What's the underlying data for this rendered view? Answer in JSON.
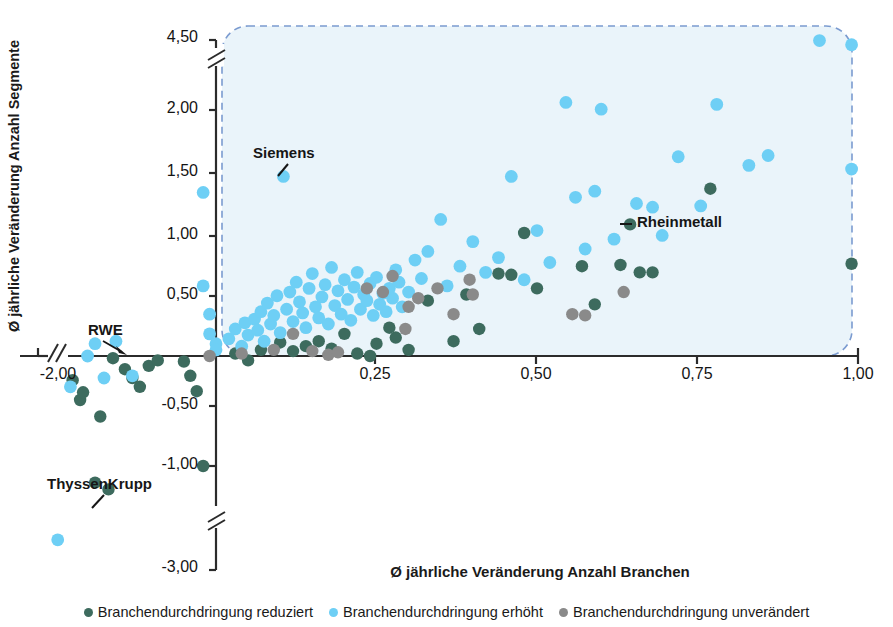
{
  "chart_data": {
    "type": "scatter",
    "title": "",
    "xlabel": "Ø jährliche Veränderung Anzahl Branchen",
    "ylabel": "Ø jährliche Veränderung Anzahl Segmente",
    "xlim": [
      -2.25,
      1.05
    ],
    "ylim": [
      -3.1,
      4.7
    ],
    "grid": false,
    "legend_position": "bottom",
    "x_ticks": [
      {
        "value": -2.0,
        "label": "-2,00"
      },
      {
        "value": 0.25,
        "label": "0,25"
      },
      {
        "value": 0.5,
        "label": "0,50"
      },
      {
        "value": 0.75,
        "label": "0,75"
      },
      {
        "value": 1.0,
        "label": "1,00"
      }
    ],
    "y_ticks": [
      {
        "value": 4.5,
        "label": "4,50"
      },
      {
        "value": 2.0,
        "label": "2,00"
      },
      {
        "value": 1.5,
        "label": "1,50"
      },
      {
        "value": 1.0,
        "label": "1,00"
      },
      {
        "value": 0.5,
        "label": "0,50"
      },
      {
        "value": -0.5,
        "label": "-0,50"
      },
      {
        "value": -1.0,
        "label": "-1,00"
      },
      {
        "value": -3.0,
        "label": "-3,00"
      }
    ],
    "axis_breaks": {
      "y_upper": "between 2,00 and 4,50",
      "y_lower": "between -1,00 and -3,00",
      "x_left": "left of -2,00"
    },
    "highlight_region": {
      "label": "dashed rounded rectangle around positive quadrant",
      "x_from": 0.0,
      "x_to": 1.0,
      "y_from": 0.0,
      "y_to": 4.5,
      "color": "#6f8fc4"
    },
    "annotations": [
      {
        "text": "Siemens",
        "point_x": 0.105,
        "point_y": 1.46,
        "series": "erhöht"
      },
      {
        "text": "Rheinmetall",
        "point_x": 0.645,
        "point_y": 1.07,
        "series": "reduziert"
      },
      {
        "text": "RWE",
        "point_x": -1.72,
        "point_y": 0.0,
        "series": "erhöht"
      },
      {
        "text": "ThyssenKrupp",
        "point_x": -1.62,
        "point_y": -1.32,
        "series": "reduziert"
      }
    ],
    "series": [
      {
        "name": "Branchendurchdringung reduziert",
        "color": "#3d6b5e",
        "points": [
          [
            -1.92,
            -0.22
          ],
          [
            -1.82,
            -0.4
          ],
          [
            -1.78,
            -0.33
          ],
          [
            -1.62,
            -1.32
          ],
          [
            -1.55,
            -0.55
          ],
          [
            -1.44,
            -1.45
          ],
          [
            -1.38,
            -0.02
          ],
          [
            -1.22,
            -0.12
          ],
          [
            -1.12,
            -0.2
          ],
          [
            -1.02,
            -0.28
          ],
          [
            -0.9,
            -0.09
          ],
          [
            -0.78,
            -0.04
          ],
          [
            -0.05,
            -0.05
          ],
          [
            -0.04,
            -0.18
          ],
          [
            -0.03,
            -0.32
          ],
          [
            -0.02,
            -1.0
          ],
          [
            0.03,
            0.02
          ],
          [
            0.05,
            -0.04
          ],
          [
            0.07,
            0.05
          ],
          [
            0.1,
            0.11
          ],
          [
            0.12,
            0.04
          ],
          [
            0.14,
            0.08
          ],
          [
            0.16,
            0.12
          ],
          [
            0.18,
            0.06
          ],
          [
            0.2,
            0.18
          ],
          [
            0.22,
            0.02
          ],
          [
            0.24,
            0.0
          ],
          [
            0.25,
            0.1
          ],
          [
            0.27,
            0.23
          ],
          [
            0.28,
            0.15
          ],
          [
            0.3,
            0.05
          ],
          [
            0.33,
            0.45
          ],
          [
            0.37,
            0.12
          ],
          [
            0.39,
            0.5
          ],
          [
            0.41,
            0.22
          ],
          [
            0.44,
            0.67
          ],
          [
            0.46,
            0.66
          ],
          [
            0.48,
            1.0
          ],
          [
            0.5,
            0.55
          ],
          [
            0.57,
            0.73
          ],
          [
            0.59,
            0.42
          ],
          [
            0.63,
            0.74
          ],
          [
            0.645,
            1.07
          ],
          [
            0.66,
            0.68
          ],
          [
            0.68,
            0.68
          ],
          [
            0.77,
            1.36
          ],
          [
            0.99,
            0.75
          ]
        ]
      },
      {
        "name": "Branchendurchdringung erhöht",
        "color": "#6ecff5",
        "points": [
          [
            -2.12,
            -2.42
          ],
          [
            -1.95,
            -0.28
          ],
          [
            -1.72,
            0.0
          ],
          [
            -1.62,
            0.1
          ],
          [
            -1.5,
            -0.2
          ],
          [
            -1.34,
            0.12
          ],
          [
            -1.12,
            -0.18
          ],
          [
            -0.02,
            1.33
          ],
          [
            -0.02,
            0.57
          ],
          [
            -0.01,
            0.34
          ],
          [
            -0.01,
            0.18
          ],
          [
            0.0,
            0.1
          ],
          [
            0.0,
            0.05
          ],
          [
            0.02,
            0.14
          ],
          [
            0.03,
            0.22
          ],
          [
            0.04,
            0.08
          ],
          [
            0.045,
            0.27
          ],
          [
            0.05,
            0.17
          ],
          [
            0.06,
            0.3
          ],
          [
            0.065,
            0.21
          ],
          [
            0.07,
            0.36
          ],
          [
            0.075,
            0.12
          ],
          [
            0.08,
            0.43
          ],
          [
            0.085,
            0.26
          ],
          [
            0.09,
            0.33
          ],
          [
            0.095,
            0.49
          ],
          [
            0.1,
            0.19
          ],
          [
            0.105,
            1.46
          ],
          [
            0.11,
            0.38
          ],
          [
            0.115,
            0.52
          ],
          [
            0.12,
            0.28
          ],
          [
            0.125,
            0.6
          ],
          [
            0.13,
            0.44
          ],
          [
            0.135,
            0.35
          ],
          [
            0.14,
            0.23
          ],
          [
            0.145,
            0.55
          ],
          [
            0.15,
            0.67
          ],
          [
            0.155,
            0.4
          ],
          [
            0.16,
            0.31
          ],
          [
            0.165,
            0.48
          ],
          [
            0.17,
            0.58
          ],
          [
            0.175,
            0.26
          ],
          [
            0.18,
            0.72
          ],
          [
            0.185,
            0.41
          ],
          [
            0.19,
            0.53
          ],
          [
            0.195,
            0.34
          ],
          [
            0.2,
            0.62
          ],
          [
            0.205,
            0.46
          ],
          [
            0.21,
            0.29
          ],
          [
            0.215,
            0.56
          ],
          [
            0.22,
            0.68
          ],
          [
            0.225,
            0.38
          ],
          [
            0.23,
            0.5
          ],
          [
            0.235,
            0.45
          ],
          [
            0.24,
            0.59
          ],
          [
            0.245,
            0.33
          ],
          [
            0.25,
            0.64
          ],
          [
            0.255,
            0.42
          ],
          [
            0.26,
            0.51
          ],
          [
            0.265,
            0.36
          ],
          [
            0.27,
            0.55
          ],
          [
            0.275,
            0.47
          ],
          [
            0.28,
            0.7
          ],
          [
            0.285,
            0.6
          ],
          [
            0.29,
            0.4
          ],
          [
            0.3,
            0.52
          ],
          [
            0.31,
            0.78
          ],
          [
            0.32,
            0.63
          ],
          [
            0.33,
            0.85
          ],
          [
            0.35,
            1.11
          ],
          [
            0.36,
            0.57
          ],
          [
            0.38,
            0.73
          ],
          [
            0.4,
            0.93
          ],
          [
            0.42,
            0.68
          ],
          [
            0.44,
            0.8
          ],
          [
            0.46,
            1.46
          ],
          [
            0.48,
            0.62
          ],
          [
            0.5,
            1.02
          ],
          [
            0.52,
            0.76
          ],
          [
            0.545,
            2.27
          ],
          [
            0.56,
            1.29
          ],
          [
            0.575,
            0.87
          ],
          [
            0.59,
            1.34
          ],
          [
            0.6,
            2.03
          ],
          [
            0.62,
            0.95
          ],
          [
            0.655,
            1.24
          ],
          [
            0.68,
            1.21
          ],
          [
            0.695,
            0.98
          ],
          [
            0.72,
            1.62
          ],
          [
            0.755,
            1.22
          ],
          [
            0.78,
            2.2
          ],
          [
            0.83,
            1.55
          ],
          [
            0.86,
            1.63
          ],
          [
            0.94,
            4.48
          ],
          [
            0.99,
            4.33
          ],
          [
            0.99,
            1.52
          ]
        ]
      },
      {
        "name": "Branchendurchdringung unverändert",
        "color": "#8a8a8a",
        "points": [
          [
            -0.01,
            0.0
          ],
          [
            0.04,
            0.02
          ],
          [
            0.09,
            0.05
          ],
          [
            0.12,
            0.18
          ],
          [
            0.15,
            0.04
          ],
          [
            0.175,
            0.01
          ],
          [
            0.19,
            0.03
          ],
          [
            0.235,
            0.55
          ],
          [
            0.26,
            0.52
          ],
          [
            0.275,
            0.65
          ],
          [
            0.295,
            0.22
          ],
          [
            0.3,
            0.4
          ],
          [
            0.315,
            0.47
          ],
          [
            0.345,
            0.55
          ],
          [
            0.37,
            0.34
          ],
          [
            0.395,
            0.62
          ],
          [
            0.4,
            0.5
          ],
          [
            0.555,
            0.34
          ],
          [
            0.575,
            0.33
          ],
          [
            0.635,
            0.52
          ]
        ]
      }
    ]
  },
  "legend": {
    "items": [
      {
        "label": "Branchendurchdringung reduziert",
        "color": "#3d6b5e"
      },
      {
        "label": "Branchendurchdringung erhöht",
        "color": "#6ecff5"
      },
      {
        "label": "Branchendurchdringung unverändert",
        "color": "#8a8a8a"
      }
    ]
  }
}
